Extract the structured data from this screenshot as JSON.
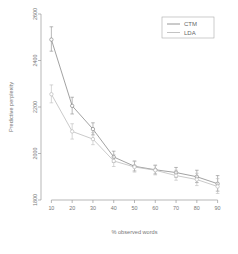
{
  "chart_data": {
    "type": "line",
    "title": "",
    "xlabel": "% observed words",
    "ylabel": "Predictive perplexity",
    "x": [
      10,
      20,
      30,
      40,
      50,
      60,
      70,
      80,
      90
    ],
    "xlim": [
      5,
      95
    ],
    "ylim": [
      1800,
      2600
    ],
    "xticks": [
      10,
      20,
      30,
      40,
      50,
      60,
      70,
      80,
      90
    ],
    "yticks": [
      1800,
      2000,
      2200,
      2400,
      2600
    ],
    "xticklabels": [
      "10",
      "20",
      "30",
      "40",
      "50",
      "60",
      "70",
      "80",
      "90"
    ],
    "yticklabels": [
      "1800",
      "2000",
      "2200",
      "2400",
      "2600"
    ],
    "grid": false,
    "legend_position": "top-right",
    "marker": "circle-open",
    "errorbars": true,
    "series": [
      {
        "name": "CTM",
        "color": "#8a8a8a",
        "values": [
          2490,
          2205,
          2105,
          1985,
          1945,
          1930,
          1918,
          1900,
          1870
        ],
        "err_low": [
          2440,
          2170,
          2080,
          1962,
          1925,
          1912,
          1898,
          1875,
          1838
        ],
        "err_high": [
          2545,
          2242,
          2132,
          2010,
          1968,
          1950,
          1940,
          1928,
          1905
        ]
      },
      {
        "name": "LDA",
        "color": "#bcbcbc",
        "values": [
          2255,
          2095,
          2062,
          1968,
          1942,
          1928,
          1905,
          1888,
          1858
        ],
        "err_low": [
          2218,
          2062,
          2038,
          1944,
          1920,
          1908,
          1885,
          1862,
          1828
        ],
        "err_high": [
          2295,
          2128,
          2090,
          1995,
          1965,
          1948,
          1928,
          1915,
          1892
        ]
      }
    ]
  },
  "legend": {
    "entries": [
      {
        "label": "CTM"
      },
      {
        "label": "LDA"
      }
    ]
  }
}
